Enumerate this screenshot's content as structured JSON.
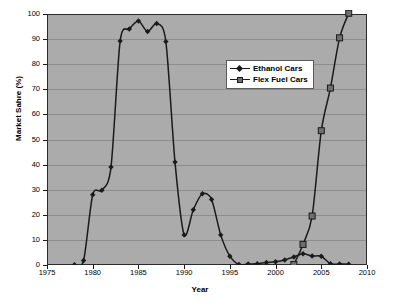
{
  "chart_data": {
    "type": "line",
    "title": "",
    "xlabel": "Year",
    "ylabel": "Market Sahre (%)",
    "xlim": [
      1975,
      2010
    ],
    "ylim": [
      0,
      100
    ],
    "xticks": [
      1975,
      1980,
      1985,
      1990,
      1995,
      2000,
      2005,
      2010
    ],
    "yticks": [
      0,
      10,
      20,
      30,
      40,
      50,
      60,
      70,
      80,
      90,
      100
    ],
    "grid": true,
    "legend_position": "upper-right-inside",
    "plot_background": "#ababab",
    "series": [
      {
        "name": "Ethanol Cars",
        "marker": "diamond",
        "color": "#1a1a1a",
        "x": [
          1978,
          1979,
          1980,
          1981,
          1982,
          1983,
          1984,
          1985,
          1986,
          1987,
          1988,
          1989,
          1990,
          1991,
          1992,
          1993,
          1994,
          1995,
          1996,
          1997,
          1998,
          1999,
          2000,
          2001,
          2002,
          2003,
          2004,
          2005,
          2006,
          2007,
          2008
        ],
        "values": [
          0.1,
          1.8,
          28.0,
          29.8,
          39.0,
          89.2,
          94.0,
          97.2,
          93.0,
          96.2,
          89.0,
          41.0,
          12.0,
          22.0,
          28.4,
          26.1,
          12.0,
          3.5,
          0.2,
          0.4,
          0.5,
          1.0,
          1.3,
          2.0,
          3.2,
          4.5,
          3.6,
          3.5,
          0.5,
          0.4,
          0.3
        ]
      },
      {
        "name": "Flex Fuel Cars",
        "marker": "square",
        "color": "#6f6f6f",
        "x": [
          2002,
          2003,
          2004,
          2005,
          2006,
          2007,
          2008
        ],
        "values": [
          0.2,
          8.2,
          19.5,
          53.5,
          70.5,
          90.5,
          100.3
        ]
      }
    ]
  },
  "legend": {
    "items": [
      {
        "label": "Ethanol Cars",
        "marker": "diamond-marker"
      },
      {
        "label": "Flex Fuel Cars",
        "marker": "square-marker"
      }
    ]
  },
  "axes": {
    "x_title": "Year",
    "y_title": "Market Sahre (%)",
    "x_tick_labels": [
      "1975",
      "1980",
      "1985",
      "1990",
      "1995",
      "2000",
      "2005",
      "2010"
    ],
    "y_tick_labels": [
      "0",
      "10",
      "20",
      "30",
      "40",
      "50",
      "60",
      "70",
      "80",
      "90",
      "100"
    ]
  }
}
